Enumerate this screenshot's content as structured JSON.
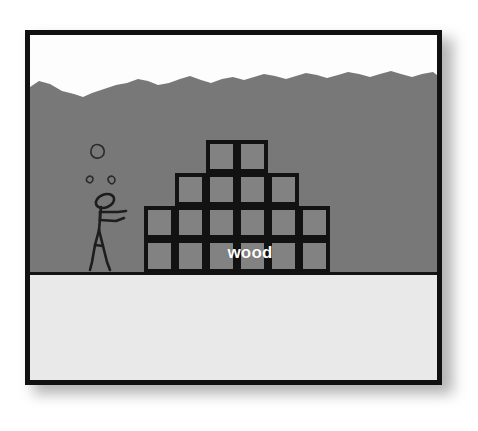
{
  "scene": {
    "title": "Stick figure mining scene with wood block stack",
    "label_wood": "wood",
    "colors": {
      "sky": "#fdfdfd",
      "underground": "#787878",
      "ground_slab": "#e9e9e9",
      "block_fill": "#828282",
      "outline": "#121212",
      "label_text": "#ffffff",
      "frame_border": "#111111",
      "page_background": "#ffffff"
    },
    "frame": {
      "x": 25,
      "y": 30,
      "width": 417,
      "height": 355,
      "border_width": 5,
      "shadow": true
    },
    "layers": [
      {
        "name": "sky",
        "description": "white sky strip above terrain"
      },
      {
        "name": "underground",
        "description": "gray dirt mass with jagged top edge"
      },
      {
        "name": "ground-slab",
        "description": "light gray ground floor band at bottom"
      }
    ],
    "terrain": {
      "description": "jagged rocky top edge of the gray underground mass",
      "baseline_y": 60,
      "points": "0,52 9,46 20,49 32,56 44,59 53,62 62,58 74,54 86,50 97,48 108,44 118,46 128,50 139,48 150,44 160,41 171,45 181,48 192,44 203,42 214,45 224,42 234,39 245,41 256,44 266,41 276,38 287,40 297,43 308,40 318,37 329,39 340,42 350,39 361,36 371,39 382,42 392,39 403,37 407,40"
    },
    "blocks": {
      "cell_size": 31,
      "description": "Pyramid stack of wooden blocks, 4 rows",
      "rows": [
        {
          "row": 1,
          "y": 0,
          "count": 2,
          "start_col": 2,
          "cols": [
            2,
            3
          ]
        },
        {
          "row": 2,
          "y": 33,
          "count": 4,
          "start_col": 1,
          "cols": [
            1,
            2,
            3,
            4
          ]
        },
        {
          "row": 3,
          "y": 66,
          "count": 6,
          "start_col": 0,
          "cols": [
            0,
            1,
            2,
            3,
            4,
            5
          ]
        },
        {
          "row": 4,
          "y": 99,
          "count": 6,
          "start_col": 0,
          "cols": [
            0,
            1,
            2,
            3,
            4,
            5
          ]
        }
      ],
      "total": 18
    },
    "character": {
      "name": "stick-figure-miner",
      "description": "stick figure with oval head, outstretched arms, and walking legs facing right"
    },
    "debris": {
      "description": "three small irregular pebbles floating above the figure",
      "count": 3
    }
  }
}
